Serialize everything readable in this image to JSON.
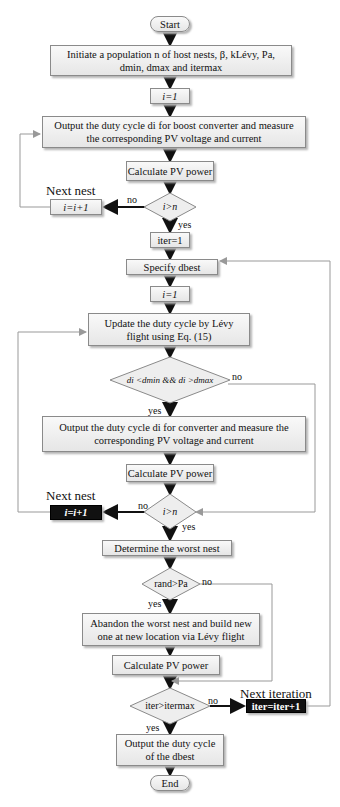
{
  "flowchart": {
    "start": "Start",
    "init": {
      "line1": "Initiate a population n of host nests, β, kLévy, Pa,",
      "line2": "dmin, dmax and itermax"
    },
    "i_init_1": "i=1",
    "output_duty_1": {
      "line1": "Output the duty cycle di for boost converter and measure",
      "line2": "the corresponding PV voltage and current"
    },
    "calc_power_1": "Calculate PV power",
    "decision_1": "i>n",
    "next_nest_label_1": "Next nest",
    "increment_1": "i=i+1",
    "iter_init": "iter=1",
    "specify_best": "Specify dbest",
    "i_init_2": "i=1",
    "update_duty": {
      "line1": "Update the duty cycle by Lévy",
      "line2": "flight using Eq. (15)"
    },
    "decision_2": "di <dmin && di >dmax",
    "output_duty_2": {
      "line1": "Output the duty cycle di for converter and measure the",
      "line2": "corresponding PV voltage and current"
    },
    "calc_power_2": "Calculate PV power",
    "decision_3": "i>n",
    "next_nest_label_2": "Next nest",
    "increment_2": "i=i+1",
    "worst_nest": "Determine the worst nest",
    "decision_4": "rand>Pa",
    "abandon": {
      "line1": "Abandon the worst nest and build new",
      "line2": "one at new location via Lévy flight"
    },
    "calc_power_3": "Calculate PV power",
    "decision_5": "iter>itermax",
    "next_iteration_label": "Next iteration",
    "increment_iter": "iter=iter+1",
    "output_best": {
      "line1": "Output the duty cycle",
      "line2": "of the dbest"
    },
    "end": "End",
    "edge_labels": {
      "yes": "yes",
      "no": "no"
    }
  }
}
